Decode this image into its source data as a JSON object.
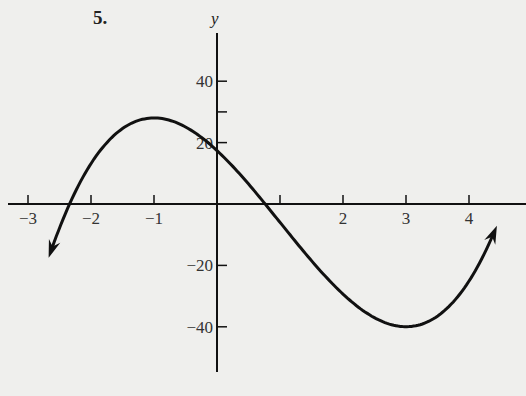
{
  "problem_number": "5.",
  "chart_data": {
    "type": "line",
    "title": "",
    "xlabel": "",
    "ylabel": "y",
    "x_ticks": [
      -3,
      -2,
      -1,
      1,
      2,
      3,
      4
    ],
    "x_tick_labels": [
      "−3",
      "−2",
      "−1",
      "",
      "2",
      "3",
      "4"
    ],
    "y_ticks": [
      40,
      20,
      -20,
      -40
    ],
    "y_tick_labels": [
      "40",
      "20",
      "−20",
      "−40"
    ],
    "y_minor_ticks": [
      30
    ],
    "xlim": [
      -3.3,
      5
    ],
    "ylim": [
      -55,
      56
    ],
    "grid": false,
    "series": [
      {
        "name": "f(x)",
        "description": "cubic curve with local max near (-1, 28) and local min near (3, -40), arrows at both ends",
        "x": [
          -2.7,
          -2.3,
          -2,
          -1.5,
          -1,
          -0.5,
          0,
          0.7,
          1,
          1.5,
          2,
          2.5,
          3,
          3.5,
          4,
          4.4
        ],
        "y": [
          -18,
          0,
          12,
          23,
          28,
          26,
          17,
          0,
          -8,
          -21,
          -32,
          -38,
          -40,
          -36,
          -25,
          -12
        ]
      }
    ],
    "annotations": [
      "arrowhead at left end",
      "arrowhead at right end"
    ]
  }
}
